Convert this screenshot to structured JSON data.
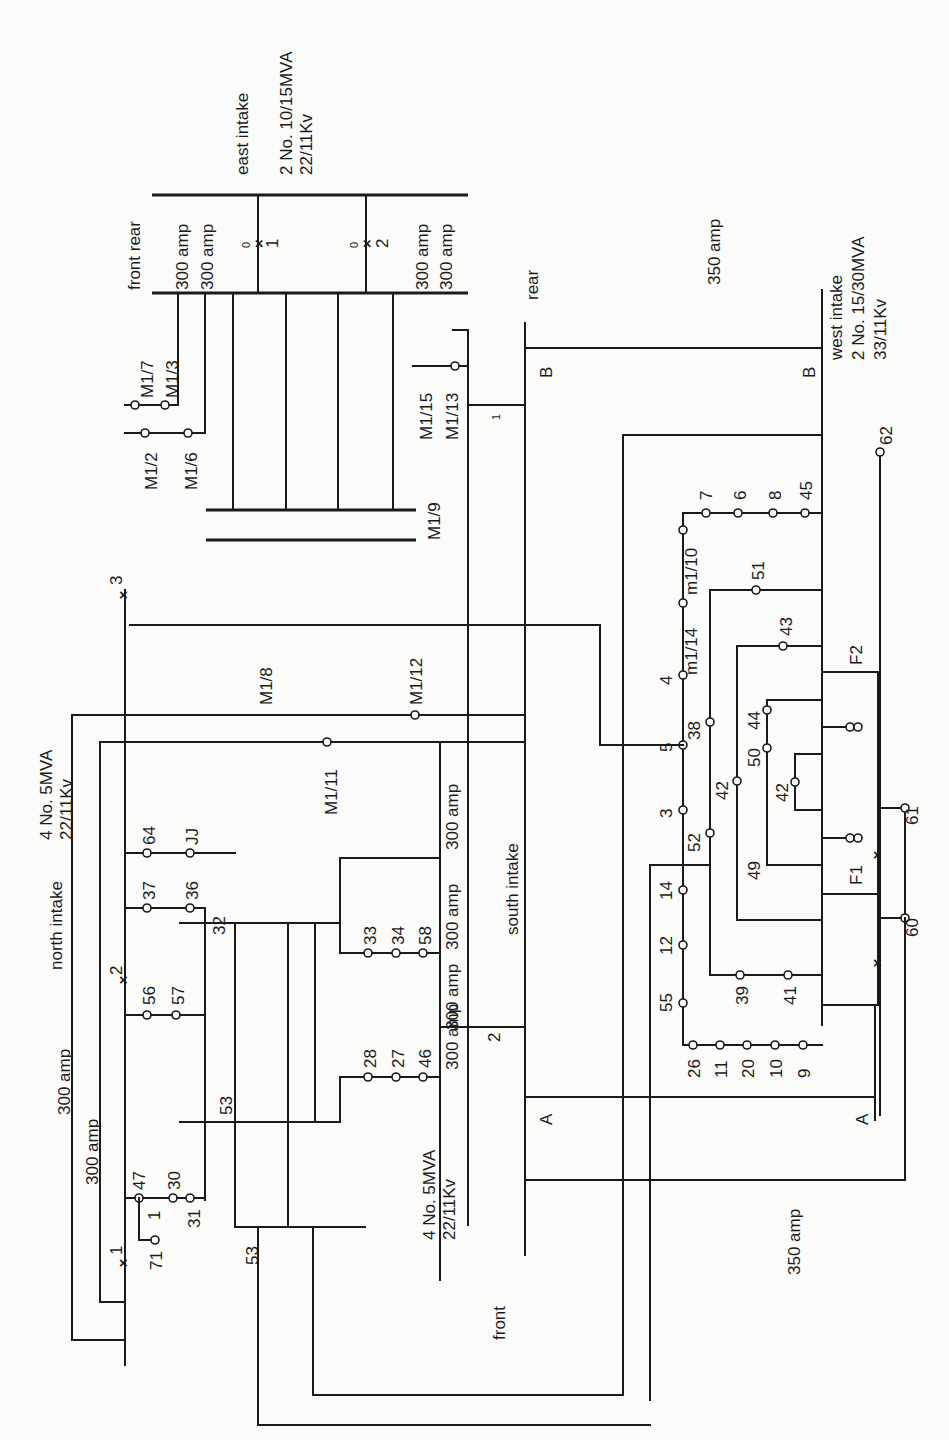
{
  "diagram": {
    "orientation": "rotated-90-ccw",
    "east_intake": {
      "title": "east intake",
      "rating": "2 No. 10/15MVA",
      "voltage": "22/11Kv",
      "front_rear": "front rear",
      "amp_1": "300 amp",
      "amp_2": "300 amp",
      "amp_3": "300 amp",
      "amp_4": "300 amp",
      "breaker_1": "1",
      "breaker_2": "2",
      "breaker_state": "0"
    },
    "west_intake": {
      "title": "west intake",
      "rating": "2 No. 15/30MVA",
      "voltage": "33/11Kv",
      "amp": "350 amp",
      "bus_b_left": "B",
      "bus_b_right": "B",
      "rear": "rear"
    },
    "north_intake": {
      "title": "north intake",
      "rating": "4 No. 5MVA",
      "voltage": "22/11Kv",
      "amp_1": "300 amp",
      "amp_2": "300 amp",
      "breaker_1": "1",
      "breaker_2": "2",
      "breaker_3": "3",
      "breaker_state": "0"
    },
    "south_intake": {
      "title": "south intake",
      "rating": "4 No. 5MVA",
      "voltage": "22/11Kv",
      "amp_1": "300 amp",
      "amp_2": "300 amp",
      "amp_3": "300 amp",
      "amp_4": "300 amp",
      "breaker_2": "2",
      "breaker_1": "1",
      "front": "front",
      "amp_350": "350 amp",
      "bus_a_left": "A",
      "bus_a_right": "A"
    },
    "feeders": {
      "m1_7": "M1/7",
      "m1_3": "M1/3",
      "m1_2": "M1/2",
      "m1_6": "M1/6",
      "m1_15": "M1/15",
      "m1_13": "M1/13",
      "m1_9": "M1/9",
      "m1_8": "M1/8",
      "m1_12": "M1/12",
      "m1_11": "M1/11",
      "m1_14": "m1/14",
      "m1_10": "m1/10"
    },
    "nodes": {
      "n64": "64",
      "nJJ": "JJ",
      "n37": "37",
      "n36": "36",
      "n32": "32",
      "n56": "56",
      "n57": "57",
      "n53a": "53",
      "n53b": "53",
      "n47": "47",
      "n30": "30",
      "n31": "31",
      "n1": "1",
      "n71": "71",
      "n33": "33",
      "n34": "34",
      "n58": "58",
      "n28": "28",
      "n27": "27",
      "n46": "46",
      "n7": "7",
      "n6": "6",
      "n8": "8",
      "n45": "45",
      "n62": "62",
      "n51": "51",
      "n43": "43",
      "n4": "4",
      "n5": "5",
      "n38": "38",
      "n44": "44",
      "n50": "50",
      "n42a": "42",
      "n42b": "42",
      "n3": "3",
      "n52": "52",
      "n49": "49",
      "n14": "14",
      "n12": "12",
      "n55": "55",
      "n39": "39",
      "n41": "41",
      "n26": "26",
      "n11": "11",
      "n20": "20",
      "n10": "10",
      "n9": "9",
      "n61": "61",
      "n60": "60",
      "F1": "F1",
      "F2": "F2"
    }
  }
}
